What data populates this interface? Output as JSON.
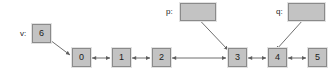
{
  "diagram": {
    "background_color": "#ffffff",
    "node_fill_color": "#c3c3c3",
    "node_border_color": "#8a8a8a",
    "edge_color": "#6f6f6f",
    "text_color": "#1b1b1b"
  },
  "variables": [
    {
      "id": "v",
      "label": "v:",
      "value": "6",
      "has_value": true
    },
    {
      "id": "p",
      "label": "p:",
      "value": "",
      "has_value": false
    },
    {
      "id": "q",
      "label": "q:",
      "value": "",
      "has_value": false
    }
  ],
  "list_nodes": [
    {
      "id": "n0",
      "label": "0"
    },
    {
      "id": "n1",
      "label": "1"
    },
    {
      "id": "n2",
      "label": "2"
    },
    {
      "id": "n3",
      "label": "3"
    },
    {
      "id": "n4",
      "label": "4"
    },
    {
      "id": "n5",
      "label": "5"
    }
  ],
  "links": [
    {
      "from": "n0",
      "to": "n1",
      "style": "double-arrow"
    },
    {
      "from": "n1",
      "to": "n2",
      "style": "double-arrow"
    },
    {
      "from": "n2",
      "to": "n3",
      "style": "double-arrow-long"
    },
    {
      "from": "n3",
      "to": "n4",
      "style": "double-arrow"
    },
    {
      "from": "n4",
      "to": "n5",
      "style": "double-arrow"
    }
  ],
  "pointer_edges": [
    {
      "from": "v",
      "to": "n0",
      "style": "arrow"
    },
    {
      "from": "p",
      "to": "n3",
      "style": "arrow"
    },
    {
      "from": "q",
      "to": "n4",
      "style": "arrow"
    }
  ]
}
